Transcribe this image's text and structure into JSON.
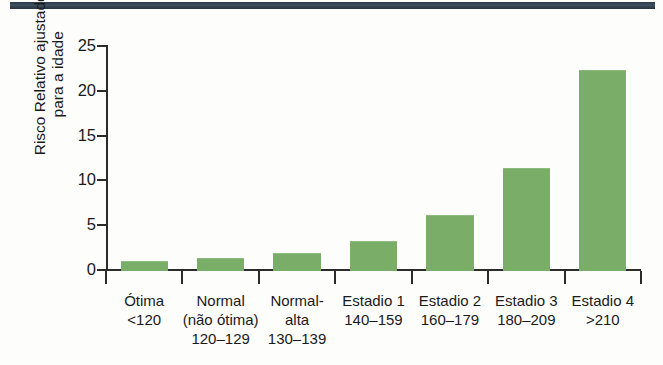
{
  "figure": {
    "top_rule_color": "#2c3a49",
    "background_color": "#fdfdfc",
    "bar_color": "#79ad68",
    "axis_color": "#2b2b2b"
  },
  "chart_data": {
    "type": "bar",
    "title": "",
    "subtitle": "",
    "xlabel": "",
    "ylabel": "Risco Relativo ajustado\npara a idade",
    "ylabel_lines": [
      "Risco Relativo ajustado",
      "para a idade"
    ],
    "ylim": [
      0,
      25
    ],
    "yticks": [
      0,
      5,
      10,
      15,
      20,
      25
    ],
    "ytick_labels": [
      "0",
      "5",
      "10",
      "15",
      "20",
      "25"
    ],
    "grid": false,
    "legend": null,
    "bar_color": "#79ad68",
    "categories": [
      "Ótima\n<120",
      "Normal\n(não ótima)\n120–129",
      "Normal-\nalta\n130–139",
      "Estadio 1\n140–159",
      "Estadio 2\n160–179",
      "Estadio 3\n180–209",
      "Estadio 4\n>210"
    ],
    "category_lines": [
      [
        "Ótima",
        "<120"
      ],
      [
        "Normal",
        "(não ótima)",
        "120–129"
      ],
      [
        "Normal-",
        "alta",
        "130–139"
      ],
      [
        "Estadio 1",
        "140–159"
      ],
      [
        "Estadio 2",
        "160–179"
      ],
      [
        "Estadio 3",
        "180–209"
      ],
      [
        "Estadio 4",
        ">210"
      ]
    ],
    "values": [
      1.0,
      1.3,
      1.9,
      3.2,
      6.1,
      11.4,
      22.3
    ]
  }
}
